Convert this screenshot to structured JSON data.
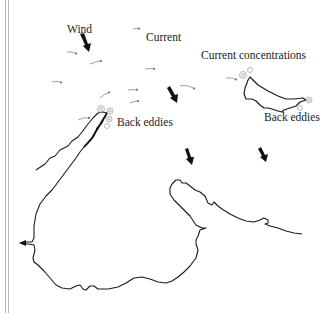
{
  "diagram": {
    "labels": {
      "wind": "Wind",
      "current": "Current",
      "current_concentrations": "Current concentrations",
      "back_eddies_left": "Back eddies",
      "back_eddies_right": "Back eddies"
    },
    "colors": {
      "coastline": "#1a1a1a",
      "wind_arrow": "#111111",
      "current_arrow": "#777777",
      "eddy": "#999999",
      "border": "#b8b8b8"
    },
    "wind_arrows": [
      {
        "x": 83,
        "y": 38
      },
      {
        "x": 170,
        "y": 88
      },
      {
        "x": 187,
        "y": 151
      },
      {
        "x": 260,
        "y": 151
      }
    ],
    "current_arrow_count": 11,
    "elements": [
      "coastline-peninsula",
      "coastline-bay",
      "island",
      "back-eddies",
      "current-concentrations"
    ]
  }
}
